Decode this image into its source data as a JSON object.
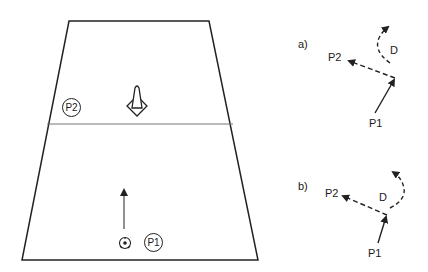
{
  "field": {
    "players": [
      {
        "id": "p2",
        "label": "P2"
      },
      {
        "id": "p1",
        "label": "P1"
      }
    ],
    "objects": [
      "cone-icon",
      "ball-icon",
      "arrow-icon"
    ]
  },
  "diagram_a": {
    "label": "a)",
    "p2_label": "P2",
    "p1_label": "P1",
    "d_label": "D"
  },
  "diagram_b": {
    "label": "b)",
    "p2_label": "P2",
    "p1_label": "P1",
    "d_label": "D"
  },
  "colors": {
    "line": "#222222",
    "midline": "#777777",
    "background": "#ffffff"
  }
}
